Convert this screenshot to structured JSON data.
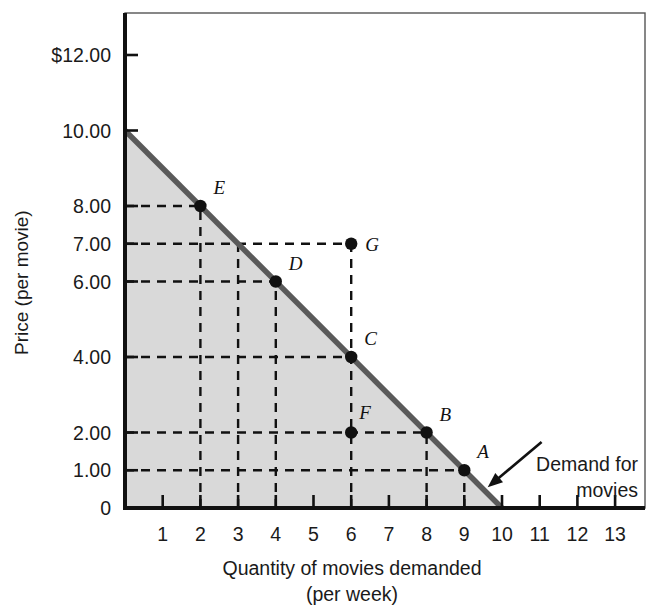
{
  "chart_data": {
    "type": "line",
    "title": "",
    "xlabel": "Quantity of movies demanded",
    "xlabel2": "(per week)",
    "ylabel": "Price (per movie)",
    "xlim": [
      0,
      13.7
    ],
    "ylim": [
      0,
      12.7
    ],
    "grid": false,
    "legend_position": "none",
    "yticks": [
      {
        "value": 12,
        "label": "$12.00"
      },
      {
        "value": 10,
        "label": "10.00"
      },
      {
        "value": 8,
        "label": "8.00"
      },
      {
        "value": 7,
        "label": "7.00"
      },
      {
        "value": 6,
        "label": "6.00"
      },
      {
        "value": 4,
        "label": "4.00"
      },
      {
        "value": 2,
        "label": "2.00"
      },
      {
        "value": 1,
        "label": "1.00"
      },
      {
        "value": 0,
        "label": "0"
      }
    ],
    "xticks": [
      {
        "value": 1,
        "label": "1"
      },
      {
        "value": 2,
        "label": "2"
      },
      {
        "value": 3,
        "label": "3"
      },
      {
        "value": 4,
        "label": "4"
      },
      {
        "value": 5,
        "label": "5"
      },
      {
        "value": 6,
        "label": "6"
      },
      {
        "value": 7,
        "label": "7"
      },
      {
        "value": 8,
        "label": "8"
      },
      {
        "value": 9,
        "label": "9"
      },
      {
        "value": 10,
        "label": "10"
      },
      {
        "value": 11,
        "label": "11"
      },
      {
        "value": 12,
        "label": "12"
      },
      {
        "value": 13,
        "label": "13"
      }
    ],
    "series": [
      {
        "name": "Demand for movies",
        "x": [
          0,
          10
        ],
        "y": [
          10,
          0
        ],
        "color": "#5a5a5a",
        "shaded_area": true,
        "shade_color": "#d9d9d9"
      }
    ],
    "points": [
      {
        "label": "A",
        "x": 9,
        "y": 1,
        "on_curve": true,
        "label_dx": 13,
        "label_dy": -12
      },
      {
        "label": "B",
        "x": 8,
        "y": 2,
        "on_curve": true,
        "label_dx": 13,
        "label_dy": -12
      },
      {
        "label": "C",
        "x": 6,
        "y": 4,
        "on_curve": true,
        "label_dx": 13,
        "label_dy": -12
      },
      {
        "label": "D",
        "x": 4,
        "y": 6,
        "on_curve": true,
        "label_dx": 13,
        "label_dy": -12
      },
      {
        "label": "E",
        "x": 2,
        "y": 8,
        "on_curve": true,
        "label_dx": 13,
        "label_dy": -12
      },
      {
        "label": "F",
        "x": 6,
        "y": 2,
        "on_curve": false,
        "label_dx": 8,
        "label_dy": -14
      },
      {
        "label": "G",
        "x": 6,
        "y": 7,
        "on_curve": false,
        "label_dx": 14,
        "label_dy": 7
      }
    ],
    "guide_lines": {
      "horizontal_from_axis_to": [
        {
          "y": 8,
          "x": 2
        },
        {
          "y": 7,
          "x": 6
        },
        {
          "y": 6,
          "x": 4
        },
        {
          "y": 4,
          "x": 6
        },
        {
          "y": 2,
          "x": 8
        },
        {
          "y": 1,
          "x": 9
        }
      ],
      "vertical_from_axis_to": [
        {
          "x": 2,
          "y": 8
        },
        {
          "x": 3,
          "y": 7
        },
        {
          "x": 4,
          "y": 6
        },
        {
          "x": 6,
          "y": 7
        },
        {
          "x": 8,
          "y": 2
        },
        {
          "x": 9,
          "y": 1
        }
      ]
    },
    "annotation": {
      "line1": "Demand for",
      "line2": "movies",
      "arrow_from": [
        11.05,
        1.75
      ],
      "arrow_to": [
        9.62,
        0.55
      ]
    },
    "colors": {
      "curve": "#5a5a5a",
      "shade": "#d9d9d9",
      "axis": "#111111",
      "dash": "#111111",
      "text": "#1a1a1a",
      "point": "#111111",
      "background": "#ffffff"
    }
  }
}
